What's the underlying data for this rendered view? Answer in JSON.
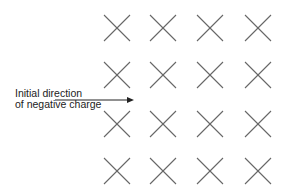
{
  "diagram": {
    "label_line1": "Initial direction",
    "label_line2": "of negative charge",
    "field_symbol": "into-page-x",
    "grid": {
      "rows": 4,
      "cols": 4,
      "col_centers": [
        117,
        163,
        210,
        258
      ],
      "row_centers": [
        28,
        75,
        124,
        171
      ],
      "half_size": 13,
      "stroke": "#666666"
    },
    "arrow": {
      "x1": 55,
      "y1": 100,
      "x2": 134,
      "y2": 100,
      "color": "#222222"
    }
  }
}
